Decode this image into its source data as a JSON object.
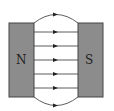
{
  "diagram": {
    "left_pole": {
      "label": "N",
      "color": "#8c8c8c"
    },
    "right_pole": {
      "label": "S",
      "color": "#8c8c8c"
    },
    "field_lines": {
      "count": 7,
      "direction": "N to S (left to right)",
      "color": "#333333"
    }
  }
}
